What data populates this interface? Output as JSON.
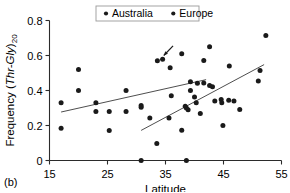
{
  "panel": {
    "label": "(b)"
  },
  "legend": {
    "position": "top-center",
    "bordered": true,
    "entries": [
      {
        "label": "Australia",
        "marker": "dot",
        "color": "#1a1a1a"
      },
      {
        "label": "Europe",
        "marker": "dot",
        "color": "#1a1a1a"
      }
    ]
  },
  "chart_data": {
    "type": "scatter",
    "title": "",
    "xlabel": "Latitude",
    "ylabel": "Frequency (Thr-Gly)20",
    "ylabel_parts": {
      "prefix": "Frequency (",
      "italic": "Thr-Gly",
      "close": ")",
      "subscript": "20"
    },
    "xlim": [
      15,
      55
    ],
    "ylim": [
      0,
      0.8
    ],
    "xticks": [
      15,
      25,
      35,
      45,
      55
    ],
    "yticks": [
      0,
      0.2,
      0.4,
      0.6,
      0.8
    ],
    "xticklabels": [
      "15",
      "25",
      "35",
      "45",
      "55"
    ],
    "yticklabels": [
      "0",
      "0.2",
      "0.4",
      "0.6",
      "0.8"
    ],
    "grid": false,
    "series": [
      {
        "name": "Australia",
        "marker": "dot",
        "color": "#1a1a1a",
        "points": [
          [
            17.0,
            0.33
          ],
          [
            17.0,
            0.185
          ],
          [
            20.0,
            0.52
          ],
          [
            20.0,
            0.4
          ],
          [
            23.0,
            0.33
          ],
          [
            23.0,
            0.28
          ],
          [
            25.3,
            0.28
          ],
          [
            25.3,
            0.172
          ],
          [
            28.2,
            0.4
          ],
          [
            28.2,
            0.28
          ],
          [
            30.8,
            0.315
          ],
          [
            30.8,
            0.305
          ],
          [
            30.8,
            0.0
          ],
          [
            32.3,
            0.243
          ],
          [
            33.6,
            0.57
          ],
          [
            34.5,
            0.578
          ],
          [
            33.5,
            0.097
          ],
          [
            35.8,
            0.53
          ],
          [
            36.0,
            0.37
          ],
          [
            35.6,
            0.243
          ],
          [
            37.8,
            0.61
          ],
          [
            37.8,
            0.173
          ],
          [
            38.6,
            0.0
          ],
          [
            39.3,
            0.45
          ],
          [
            39.3,
            0.4
          ],
          [
            41.6,
            0.572
          ],
          [
            40.5,
            0.442
          ],
          [
            41.0,
            0.268
          ]
        ]
      },
      {
        "name": "Europe",
        "marker": "dot",
        "color": "#1a1a1a",
        "points": [
          [
            38.4,
            0.31
          ],
          [
            38.6,
            0.3
          ],
          [
            38.9,
            0.29
          ],
          [
            40.0,
            0.363
          ],
          [
            40.3,
            0.33
          ],
          [
            41.6,
            0.443
          ],
          [
            42.6,
            0.428
          ],
          [
            43.1,
            0.422
          ],
          [
            42.6,
            0.65
          ],
          [
            43.5,
            0.34
          ],
          [
            44.6,
            0.348
          ],
          [
            44.7,
            0.33
          ],
          [
            44.9,
            0.2
          ],
          [
            45.9,
            0.345
          ],
          [
            46.0,
            0.54
          ],
          [
            46.8,
            0.34
          ],
          [
            47.8,
            0.292
          ],
          [
            51.0,
            0.455
          ],
          [
            51.3,
            0.515
          ],
          [
            52.3,
            0.715
          ]
        ]
      }
    ],
    "trendlines": [
      {
        "name": "Australia",
        "x0": 17.0,
        "y0": 0.277,
        "x1": 42.0,
        "y1": 0.462,
        "color": "#3a3a3a"
      },
      {
        "name": "Europe",
        "x0": 30.8,
        "y0": 0.172,
        "x1": 52.0,
        "y1": 0.548,
        "color": "#3a3a3a"
      }
    ],
    "annotations": [
      {
        "type": "arrow",
        "name": "highlight-arrow",
        "tail_x": 36.3,
        "tail_y": 0.655,
        "head_x": 34.7,
        "head_y": 0.6,
        "color": "#1a1a1a"
      }
    ]
  }
}
